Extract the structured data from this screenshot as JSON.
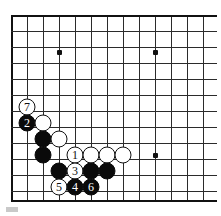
{
  "diagram": {
    "board": {
      "type": "go-board-partial",
      "grid_origin_x": 11,
      "grid_origin_y": 15,
      "grid_spacing": 16,
      "columns": 13,
      "rows": 12,
      "vertical_line_x": [
        11,
        27,
        43,
        59,
        75,
        91,
        107,
        123,
        139,
        155,
        171,
        187,
        203
      ],
      "horizontal_line_y": [
        15,
        31,
        47,
        63,
        79,
        95,
        111,
        127,
        143,
        159,
        175,
        191
      ],
      "edge_left_x": 11,
      "edge_bottom_y": 200,
      "edge_top_y": 15,
      "star_points": [
        {
          "x": 59,
          "y": 52
        },
        {
          "x": 155,
          "y": 52
        },
        {
          "x": 155,
          "y": 155
        }
      ]
    },
    "stones": [
      {
        "color": "white",
        "label": "7",
        "x": 27,
        "y": 107,
        "numbered": true
      },
      {
        "color": "black",
        "label": "2",
        "x": 27,
        "y": 123,
        "numbered": true
      },
      {
        "color": "white",
        "label": "",
        "x": 43,
        "y": 123,
        "numbered": false
      },
      {
        "color": "black",
        "label": "",
        "x": 43,
        "y": 139,
        "numbered": false
      },
      {
        "color": "white",
        "label": "",
        "x": 59,
        "y": 139,
        "numbered": false
      },
      {
        "color": "black",
        "label": "",
        "x": 43,
        "y": 155,
        "numbered": false
      },
      {
        "color": "white",
        "label": "1",
        "x": 75,
        "y": 155,
        "numbered": true
      },
      {
        "color": "white",
        "label": "",
        "x": 91,
        "y": 155,
        "numbered": false
      },
      {
        "color": "white",
        "label": "",
        "x": 107,
        "y": 155,
        "numbered": false
      },
      {
        "color": "white",
        "label": "",
        "x": 123,
        "y": 155,
        "numbered": false
      },
      {
        "color": "black",
        "label": "",
        "x": 59,
        "y": 171,
        "numbered": false
      },
      {
        "color": "white",
        "label": "3",
        "x": 75,
        "y": 171,
        "numbered": true
      },
      {
        "color": "black",
        "label": "",
        "x": 91,
        "y": 171,
        "numbered": false
      },
      {
        "color": "black",
        "label": "",
        "x": 107,
        "y": 171,
        "numbered": false
      },
      {
        "color": "white",
        "label": "5",
        "x": 59,
        "y": 187,
        "numbered": true
      },
      {
        "color": "black",
        "label": "4",
        "x": 75,
        "y": 187,
        "numbered": true
      },
      {
        "color": "black",
        "label": "6",
        "x": 91,
        "y": 187,
        "numbered": true
      }
    ],
    "move_sequence": [
      "1",
      "2",
      "3",
      "4",
      "5",
      "6",
      "7"
    ],
    "colors": {
      "board_background": "#ffffff",
      "grid_line": "#2b2b2b",
      "edge_line": "#111111",
      "black_stone": "#0a0a0a",
      "white_stone": "#ffffff",
      "white_stone_border": "#111111"
    }
  }
}
